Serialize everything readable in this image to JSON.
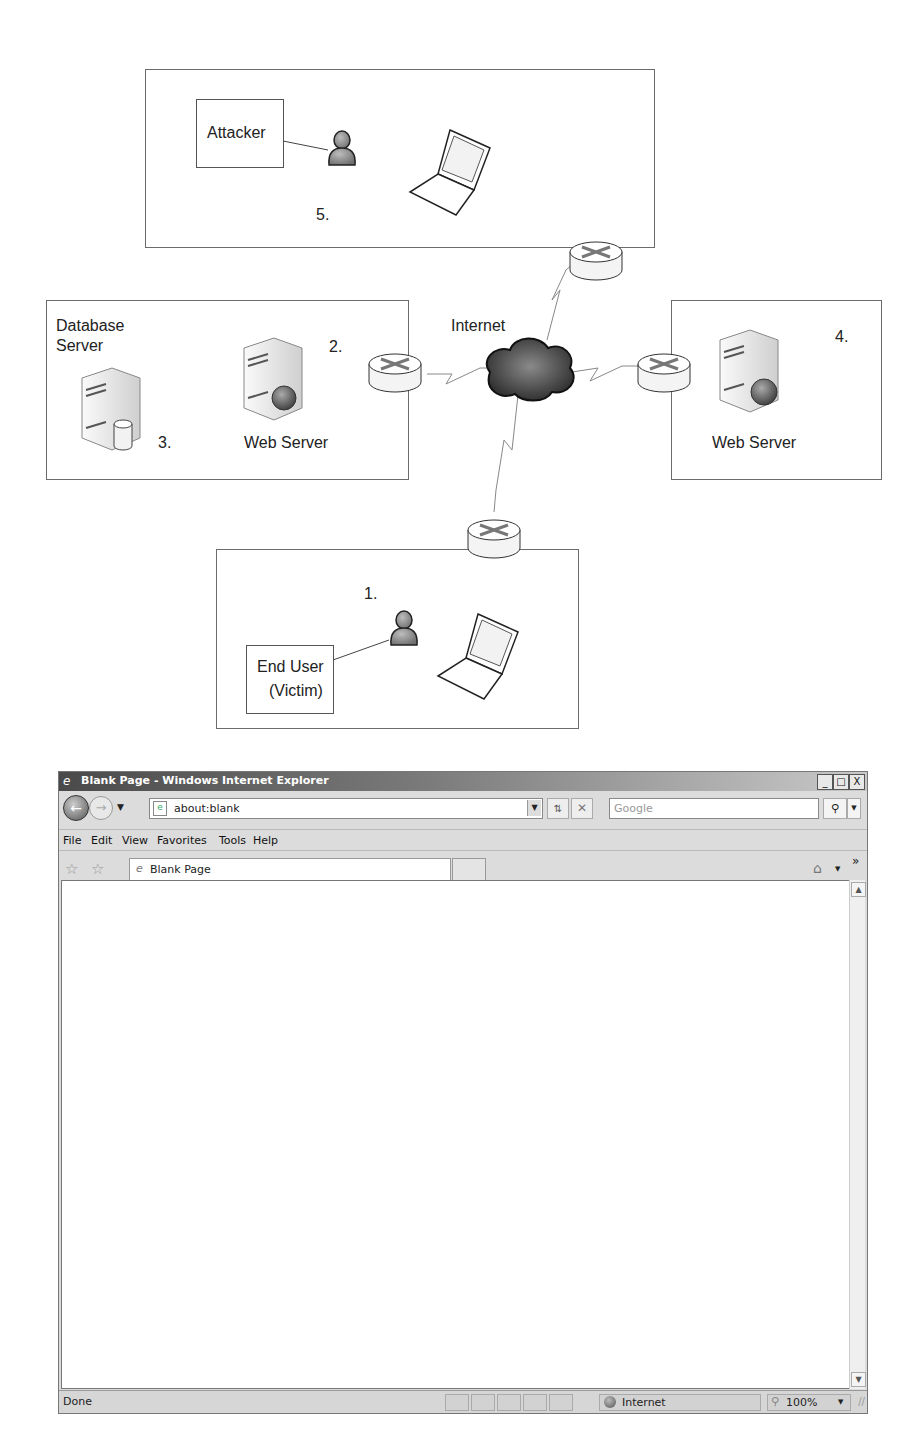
{
  "diagram": {
    "zones": {
      "attacker": {
        "number": "5.",
        "box_label": "Attacker"
      },
      "server_site": {
        "db_label_line1": "Database",
        "db_label_line2": "Server",
        "db_number": "3.",
        "web_number": "2.",
        "web_label": "Web Server"
      },
      "remote_web": {
        "number": "4.",
        "web_label": "Web Server"
      },
      "end_user": {
        "number": "1.",
        "box_label_line1": "End User",
        "box_label_line2": "(Victim)"
      }
    },
    "internet_label": "Internet",
    "icons": [
      "person-icon",
      "laptop-icon",
      "router-icon",
      "server-icon",
      "database-icon",
      "globe-icon",
      "cloud-icon",
      "lightning-link-icon"
    ]
  },
  "browser": {
    "title": "Blank Page - Windows Internet Explorer",
    "window_buttons": {
      "minimize": "_",
      "maximize": "□",
      "close": "X"
    },
    "address": "about:blank",
    "search_placeholder": "Google",
    "menu": [
      "File",
      "Edit",
      "View",
      "Favorites",
      "Tools",
      "Help"
    ],
    "tab_title": "Blank Page",
    "more_label": "»",
    "status": {
      "text": "Done",
      "zone": "Internet",
      "zoom": "100%"
    }
  }
}
